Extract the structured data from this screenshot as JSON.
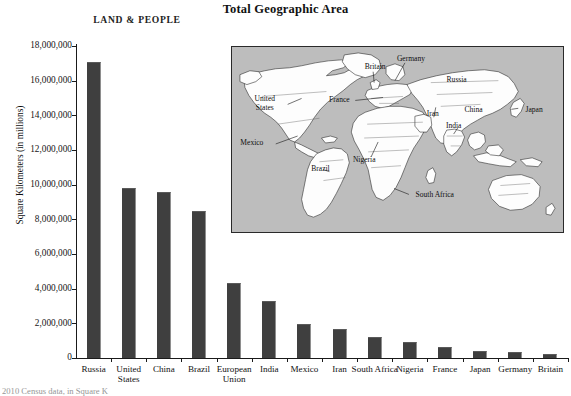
{
  "header": {
    "title": "Total Geographic Area",
    "section_label": "LAND & PEOPLE"
  },
  "footer": {
    "note": "2010 Census data, in Square K"
  },
  "chart_data": {
    "type": "bar",
    "title": "Total Geographic Area",
    "xlabel": "",
    "ylabel": "Square Kilometers (in millions)",
    "ylim": [
      0,
      18000000
    ],
    "ytick_step": 2000000,
    "grid": false,
    "legend": "none",
    "bar_color": "#3f3f3f",
    "categories": [
      "Russia",
      "United States",
      "China",
      "Brazil",
      "European Union",
      "India",
      "Mexico",
      "Iran",
      "South Africa",
      "Nigeria",
      "France",
      "Japan",
      "Germany",
      "Britain"
    ],
    "values": [
      17100000,
      9800000,
      9600000,
      8500000,
      4300000,
      3300000,
      1960000,
      1650000,
      1220000,
      920000,
      640000,
      380000,
      360000,
      240000
    ],
    "ytick_labels": [
      "18,000,000",
      "16,000,000",
      "14,000,000",
      "12,000,000",
      "10,000,000",
      "8,000,000",
      "6,000,000",
      "4,000,000",
      "2,000,000",
      "0"
    ],
    "ytick_values": [
      18000000,
      16000000,
      14000000,
      12000000,
      10000000,
      8000000,
      6000000,
      4000000,
      2000000,
      0
    ]
  },
  "map": {
    "background_color": "#bdbdbd",
    "land_color": "#fdfdfd",
    "labels": [
      "United States",
      "Mexico",
      "Brazil",
      "Britain",
      "France",
      "Germany",
      "Russia",
      "Nigeria",
      "Iran",
      "India",
      "China",
      "Japan",
      "South Africa"
    ]
  }
}
